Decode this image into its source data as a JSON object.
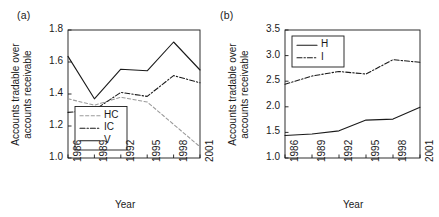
{
  "figure": {
    "background": "#ffffff",
    "ink": "#1a1a1a",
    "gray_series_color": "#9a9a9a"
  },
  "panels": [
    {
      "key": "a",
      "label": "(a)",
      "ylabel_line1": "Accounts tradable over",
      "ylabel_line2": "accounts receivable",
      "xlabel": "Year"
    },
    {
      "key": "b",
      "label": "(b)",
      "ylabel_line1": "Accounts tradable over",
      "ylabel_line2": "accounts receivable",
      "xlabel": "Year"
    }
  ],
  "chart_data": [
    {
      "type": "line",
      "panel": "(a)",
      "title": "",
      "xlabel": "Year",
      "ylabel": "Accounts tradable over accounts receivable",
      "x": [
        1986,
        1989,
        1992,
        1995,
        1998,
        2001
      ],
      "xticklabels": [
        "1986",
        "1989",
        "1992",
        "1995",
        "1998",
        "2001"
      ],
      "yticklabels": [
        "1.0",
        "1.2",
        "1.4",
        "1.6",
        "1.8"
      ],
      "yticks": [
        1.0,
        1.2,
        1.4,
        1.6,
        1.8
      ],
      "ylim": [
        1.0,
        1.8
      ],
      "grid": false,
      "legend_position": "lower-left-inside",
      "series": [
        {
          "name": "HC",
          "style": "dashed",
          "color": "#9a9a9a",
          "values": [
            1.37,
            1.33,
            1.38,
            1.35,
            1.21,
            1.07
          ]
        },
        {
          "name": "IC",
          "style": "dash-dot",
          "color": "#1a1a1a",
          "values": [
            1.285,
            1.3,
            1.41,
            1.385,
            1.515,
            1.47
          ]
        },
        {
          "name": "V",
          "style": "solid",
          "color": "#1a1a1a",
          "values": [
            1.635,
            1.37,
            1.555,
            1.545,
            1.725,
            1.55
          ]
        }
      ]
    },
    {
      "type": "line",
      "panel": "(b)",
      "title": "",
      "xlabel": "Year",
      "ylabel": "Accounts tradable over accounts receivable",
      "x": [
        1986,
        1989,
        1992,
        1995,
        1998,
        2001
      ],
      "xticklabels": [
        "1986",
        "1989",
        "1992",
        "1995",
        "1998",
        "2001"
      ],
      "yticklabels": [
        "1.0",
        "1.5",
        "2.0",
        "2.5",
        "3.0",
        "3.5"
      ],
      "yticks": [
        1.0,
        1.5,
        2.0,
        2.5,
        3.0,
        3.5
      ],
      "ylim": [
        1.0,
        3.5
      ],
      "grid": false,
      "legend_position": "upper-left-inside",
      "series": [
        {
          "name": "H",
          "style": "solid",
          "color": "#1a1a1a",
          "values": [
            1.44,
            1.47,
            1.53,
            1.74,
            1.76,
            1.99
          ]
        },
        {
          "name": "I",
          "style": "dash-dot",
          "color": "#1a1a1a",
          "values": [
            2.44,
            2.6,
            2.69,
            2.64,
            2.92,
            2.87
          ]
        }
      ]
    }
  ]
}
